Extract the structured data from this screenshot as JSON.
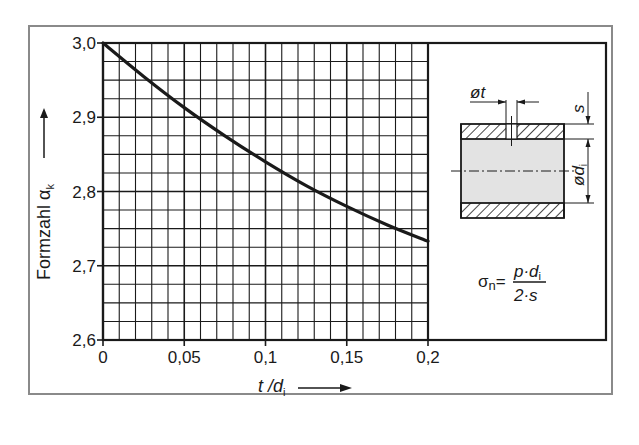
{
  "chart_data": {
    "type": "line",
    "title": "",
    "xlabel": "t / d_i",
    "xlabel_main": "t /d",
    "xlabel_sub": "i",
    "ylabel": "Formzahl α_k",
    "ylabel_main": "Formzahl α",
    "ylabel_sub": "k",
    "xlim": [
      0,
      0.2
    ],
    "ylim": [
      2.6,
      3.0
    ],
    "x_ticks": [
      0,
      0.05,
      0.1,
      0.15,
      0.2
    ],
    "x_tick_labels": [
      "0",
      "0,05",
      "0,1",
      "0,15",
      "0,2"
    ],
    "y_ticks": [
      2.6,
      2.7,
      2.8,
      2.9,
      3.0
    ],
    "y_tick_labels": [
      "2,6",
      "2,7",
      "2,8",
      "2,9",
      "3,0"
    ],
    "grid": true,
    "grid_minor_x_step": 0.01,
    "grid_minor_y_step": 0.025,
    "legend": "none",
    "series": [
      {
        "name": "Formzahl α_k",
        "x": [
          0,
          0.025,
          0.05,
          0.075,
          0.1,
          0.125,
          0.15,
          0.175,
          0.2
        ],
        "y": [
          3.0,
          2.955,
          2.913,
          2.875,
          2.84,
          2.808,
          2.78,
          2.755,
          2.733
        ]
      }
    ],
    "annotations": {
      "diagram_labels": {
        "hole_diameter": "øt",
        "wall_thickness": "s",
        "inner_diameter": "ød",
        "inner_diameter_sub": "i"
      },
      "formula": {
        "lhs": "σ",
        "lhs_sub": "n",
        "equals": "=",
        "numerator": "p·d",
        "numerator_sub": "i",
        "denominator": "2·s"
      }
    }
  },
  "colors": {
    "line": "#1a1a1a",
    "grid": "#1a1a1a",
    "outer_frame": "#8a8a8a",
    "pipe_fill": "#e3e3e3"
  }
}
